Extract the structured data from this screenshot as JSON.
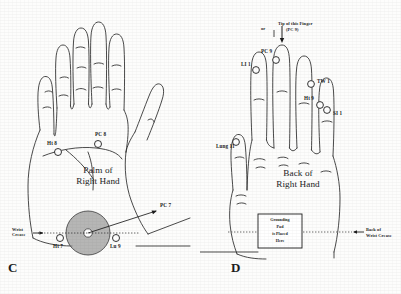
{
  "figure": {
    "background_color": "#fdfdfc",
    "ink_color": "#1c1c1c",
    "pad_fill_color": "#9a9a9a"
  },
  "panel_c": {
    "letter": "C",
    "caption_line1": "Palm of",
    "caption_line2": "Right Hand",
    "points": [
      {
        "id": "ht8",
        "label": "Ht 8"
      },
      {
        "id": "pc8",
        "label": "PC 8"
      },
      {
        "id": "ht7",
        "label": "Ht 7"
      },
      {
        "id": "lu9",
        "label": "Lu 9"
      },
      {
        "id": "pc7",
        "label": "PC 7"
      }
    ],
    "wrist_crease_line1": "Wrist",
    "wrist_crease_line2": "Crease"
  },
  "panel_d": {
    "letter": "D",
    "caption_line1": "Back of",
    "caption_line2": "Right Hand",
    "or_label": "or",
    "tip_line1": "Tip of this Finger",
    "tip_line2": "(PC 9)",
    "points": [
      {
        "id": "li1",
        "label": "LI 1"
      },
      {
        "id": "pc9",
        "label": "PC 9"
      },
      {
        "id": "tw1",
        "label": "TW 1"
      },
      {
        "id": "ht9",
        "label": "Ht 9"
      },
      {
        "id": "si1",
        "label": "SI 1"
      },
      {
        "id": "lung11",
        "label": "Lung 11"
      }
    ],
    "grounding_box": {
      "line1": "Grounding",
      "line2": "Pad",
      "line3": "is Placed",
      "line4": "Here"
    },
    "back_crease_line1": "Back of",
    "back_crease_line2": "Wrist Crease"
  }
}
